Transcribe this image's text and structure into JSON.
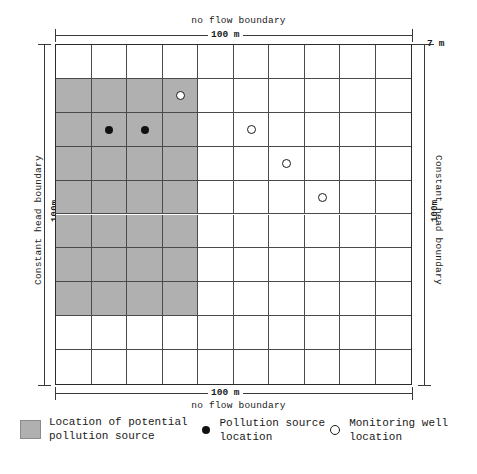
{
  "figure": {
    "domain_label_top": "no flow boundary",
    "domain_label_bottom": "no flow boundary",
    "domain_label_left": "Constant head boundary",
    "domain_label_right": "Constant head boundary",
    "dim_top": "100 m",
    "dim_bottom": "100 m",
    "dim_left": "100m",
    "dim_right": "100m",
    "dim_thickness": "7 m",
    "dim_cell": "10m"
  },
  "chart_data": {
    "type": "heatmap",
    "title": "",
    "xlabel": "100 m",
    "ylabel": "100m",
    "grid": true,
    "columns": 10,
    "rows": 10,
    "cell_size_m": 10,
    "domain_width_m": 100,
    "domain_height_m": 100,
    "aquifer_thickness_m": 7,
    "boundaries": {
      "top": "no flow boundary",
      "bottom": "no flow boundary",
      "left": "Constant head boundary",
      "right": "Constant head boundary"
    },
    "shaded_cells_note": "Potential pollution source zone: columns 1-4, rows 2-8",
    "shaded_col_range": [
      1,
      4
    ],
    "shaded_row_range": [
      2,
      8
    ],
    "pollution_sources": [
      {
        "col": 2,
        "row": 3
      },
      {
        "col": 3,
        "row": 3
      }
    ],
    "monitoring_wells": [
      {
        "col": 4,
        "row": 2
      },
      {
        "col": 6,
        "row": 3
      },
      {
        "col": 7,
        "row": 4
      },
      {
        "col": 8,
        "row": 5
      }
    ],
    "colors": {
      "shaded": "#b0b0b0",
      "grid_line": "#4a4a4a",
      "border": "#2b2b2b",
      "source_marker": "#111111",
      "well_marker": "#ffffff"
    }
  },
  "legend": {
    "items": [
      {
        "name": "potential-source-zone",
        "label": "Location of potential\npollution source",
        "symbol": "filled-square"
      },
      {
        "name": "pollution-source",
        "label": "Pollution source\nlocation",
        "symbol": "filled-circle"
      },
      {
        "name": "monitoring-well",
        "label": "Monitoring well\nlocation",
        "symbol": "open-circle"
      }
    ]
  }
}
